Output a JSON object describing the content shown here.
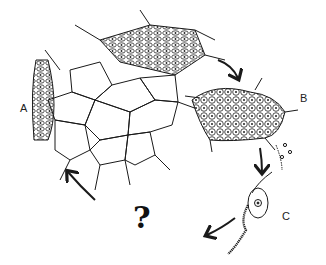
{
  "diagram": {
    "type": "biological cell life-cycle illustration",
    "labels": {
      "a": "A",
      "b": "B",
      "c": "C",
      "question": "?"
    },
    "stages": [
      {
        "id": "A",
        "description": "branching reticulate network of spindle-shaped cells"
      },
      {
        "id": "B",
        "description": "compact cluster of rounded cells releasing spores"
      },
      {
        "id": "C",
        "description": "single flagellated swimming cell"
      }
    ],
    "arrows": [
      {
        "from": "A",
        "to": "B"
      },
      {
        "from": "B",
        "to": "C"
      },
      {
        "from": "C",
        "to": "?"
      },
      {
        "from": "?",
        "to": "A"
      }
    ],
    "colors": {
      "ink": "#1a1a1a",
      "background": "#ffffff"
    }
  }
}
